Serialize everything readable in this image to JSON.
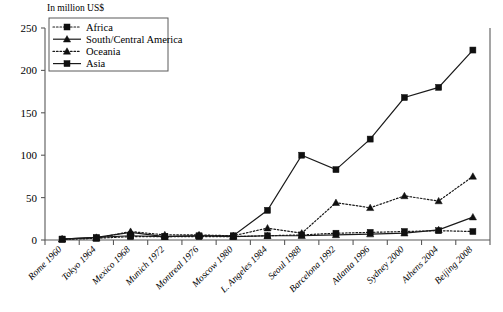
{
  "chart_data": {
    "type": "line",
    "title": "",
    "xlabel": "",
    "ylabel": "In million US$",
    "ylim": [
      0,
      250
    ],
    "yticks": [
      0,
      50,
      100,
      150,
      200,
      250
    ],
    "grid": false,
    "legend_position": "top-left",
    "categories": [
      "Rome 1960",
      "Tokyo 1964",
      "Mexico 1968",
      "Munich 1972",
      "Montreal 1976",
      "Moscow 1980",
      "L. Angeles 1984",
      "Seoul 1988",
      "Barcelona 1992",
      "Atlanta 1996",
      "Sydney 2000",
      "Athens 2004",
      "Beijing 2008"
    ],
    "series": [
      {
        "name": "Africa",
        "line_style": "dotted",
        "marker": "square",
        "values": [
          1,
          2,
          4,
          4,
          4,
          4,
          5,
          6,
          8,
          9,
          10,
          11,
          10
        ]
      },
      {
        "name": "South/Central America",
        "line_style": "solid",
        "marker": "triangle",
        "values": [
          1,
          3,
          9,
          4,
          5,
          4,
          5,
          5,
          6,
          7,
          8,
          12,
          27
        ]
      },
      {
        "name": "Oceania",
        "line_style": "dotted",
        "marker": "triangle",
        "values": [
          1,
          2,
          10,
          6,
          6,
          5,
          14,
          8,
          44,
          38,
          52,
          46,
          75
        ]
      },
      {
        "name": "Asia",
        "line_style": "solid",
        "marker": "square",
        "values": [
          1,
          3,
          5,
          4,
          5,
          5,
          35,
          100,
          83,
          119,
          168,
          180,
          224
        ]
      }
    ]
  },
  "axis": {
    "y_unit_label": "In million US$"
  },
  "legend": {
    "entries": [
      "Africa",
      "South/Central America",
      "Oceania",
      "Asia"
    ]
  }
}
